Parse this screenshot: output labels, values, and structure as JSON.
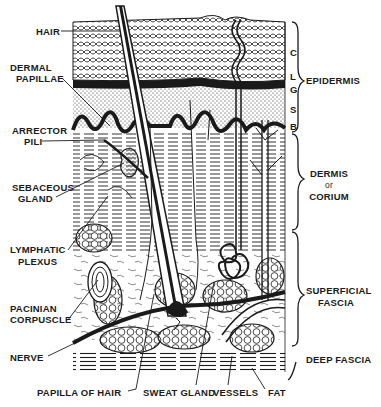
{
  "figure": {
    "colors": {
      "ink": "#1a1a1a",
      "paper": "#ffffff"
    }
  },
  "left_labels": {
    "hair": "HAIR",
    "dermal_papillae_1": "DERMAL",
    "dermal_papillae_2": "PAPILLAE",
    "arrector_pili_1": "ARRECTOR",
    "arrector_pili_2": "PILI",
    "sebaceous_gland_1": "SEBACEOUS",
    "sebaceous_gland_2": "GLAND",
    "lymphatic_plexus_1": "LYMPHATIC",
    "lymphatic_plexus_2": "PLEXUS",
    "pacinian_corpuscle_1": "PACINIAN",
    "pacinian_corpuscle_2": "CORPUSCLE",
    "nerve": "NERVE"
  },
  "bottom_labels": {
    "papilla_of_hair": "PAPILLA OF HAIR",
    "sweat_gland": "SWEAT GLAND",
    "vessels": "VESSELS",
    "fat": "FAT"
  },
  "epidermis_sublayers": [
    "C",
    "L",
    "G",
    "S",
    "B"
  ],
  "right_labels": {
    "epidermis": "EPIDERMIS",
    "dermis_1": "DERMIS",
    "dermis_2": "or",
    "dermis_3": "CORIUM",
    "superficial_fascia_1": "SUPERFICIAL",
    "superficial_fascia_2": "FASCIA",
    "deep_fascia": "DEEP FASCIA"
  }
}
